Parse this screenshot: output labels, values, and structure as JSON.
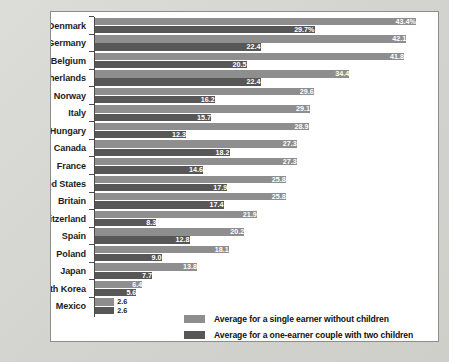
{
  "chart_data": {
    "type": "bar",
    "orientation": "horizontal",
    "title": "",
    "xlabel": "",
    "ylabel": "",
    "xlim": [
      0,
      46
    ],
    "grid": false,
    "legend_position": "bottom-right",
    "value_suffix_first_row": "%",
    "categories": [
      "Denmark",
      "Germany",
      "Belgium",
      "Netherlands",
      "Norway",
      "Italy",
      "Hungary",
      "Canada",
      "France",
      "United States",
      "Britain",
      "Switzerland",
      "Spain",
      "Poland",
      "Japan",
      "South Korea",
      "Mexico"
    ],
    "series": [
      {
        "name": "Average for a single earner without children",
        "color": "#8e8e8e",
        "values": [
          43.4,
          42.1,
          41.8,
          34.4,
          29.6,
          29.1,
          28.9,
          27.3,
          27.3,
          25.8,
          25.8,
          21.9,
          20.2,
          18.1,
          13.8,
          6.4,
          2.6
        ],
        "labels": [
          "43.4%",
          "42.1",
          "41.8",
          "34.4",
          "29.6",
          "29.1",
          "28.9",
          "27.3",
          "27.3",
          "25.8",
          "25.8",
          "21.9",
          "20.2",
          "18.1",
          "13.8",
          "6.4",
          "2.6"
        ]
      },
      {
        "name": "Average for a one-earner couple with two children",
        "color": "#575757",
        "values": [
          29.7,
          22.4,
          20.5,
          22.4,
          16.2,
          15.7,
          12.3,
          18.2,
          14.6,
          17.9,
          17.4,
          8.3,
          12.8,
          9.0,
          7.7,
          5.6,
          2.6
        ],
        "labels": [
          "29.7%",
          "22.4",
          "20.5",
          "22.4",
          "16.2",
          "15.7",
          "12.3",
          "18.2",
          "14.6",
          "17.9",
          "17.4",
          "8.3",
          "12.8",
          "9.0",
          "7.7",
          "5.6",
          "2.6"
        ]
      }
    ]
  },
  "legend": {
    "items": [
      {
        "label": "Average for a single earner without children",
        "color": "#8e8e8e"
      },
      {
        "label": "Average for a one-earner couple with two children",
        "color": "#575757"
      }
    ]
  }
}
